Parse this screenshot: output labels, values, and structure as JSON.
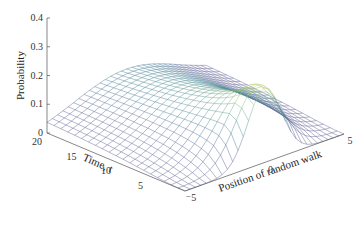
{
  "chart_data": {
    "type": "surface",
    "title": "",
    "xlabel": "Position of random walk",
    "ylabel": "Time, t",
    "zlabel": "Probability",
    "x_ticks": [
      "-5",
      "0",
      "5"
    ],
    "y_ticks": [
      "5",
      "10",
      "15",
      "20"
    ],
    "z_ticks": [
      "0",
      "0.1",
      "0.2",
      "0.3",
      "0.4"
    ],
    "x_range": [
      -5,
      5
    ],
    "y_range": [
      0,
      20
    ],
    "z_range": [
      0,
      0.4
    ],
    "grid": false,
    "colormap": "viridis-like (low = slate blue, high = yellow-green)",
    "peak": {
      "position": 0,
      "time": 0,
      "probability": 0.25
    },
    "mesh": {
      "positions": 31,
      "times": 21
    }
  },
  "labels": {
    "z_axis": "Probability",
    "time_axis": "Time, t",
    "position_axis": "Position of random walk"
  }
}
